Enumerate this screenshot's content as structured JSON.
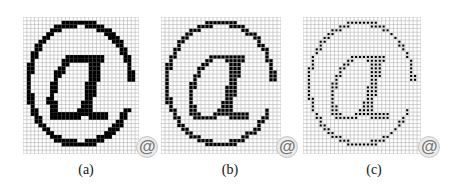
{
  "figure": {
    "panels": [
      {
        "id": "a",
        "label": "(a)",
        "style": "solid",
        "description": "Binary pixel rendering of @ with thick strokes"
      },
      {
        "id": "b",
        "label": "(b)",
        "style": "thin",
        "description": "Pixel rendering of @ with thinner stepped strokes"
      },
      {
        "id": "c",
        "label": "(c)",
        "style": "dots",
        "description": "Pixel rendering of @ with dot-sized pixels"
      }
    ],
    "grid": {
      "cols": 30,
      "rows": 36
    },
    "reference_glyph": "@",
    "colors": {
      "ink": "#000000",
      "grid_line": "#b4b4b4",
      "background": "#ffffff"
    }
  }
}
